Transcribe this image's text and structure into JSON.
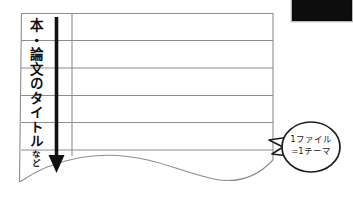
{
  "figure": {
    "type": "ruled-notebook-table-diagram",
    "background_color": "#ffffff",
    "line_color": "#8a8a8a",
    "arrow_color": "#111111",
    "callout_border_color": "#1a1a1a"
  },
  "vertical_label": {
    "main": "本・論文のタイトル",
    "suffix": "など",
    "full": "本・論文のタイトルなど",
    "orientation": "vertical",
    "name": "column-header-titles"
  },
  "arrow": {
    "name": "downward-arrow",
    "direction": "down",
    "color": "#111111"
  },
  "callout": {
    "line1": "1ファイル",
    "line2": "=1テーマ",
    "shape": "speech-balloon",
    "tail_direction": "left"
  },
  "table": {
    "rows": 6,
    "row_line_y": [
      13,
      40,
      68,
      95,
      122,
      150
    ],
    "left_column_divider_x": 72,
    "left_edge_x": 21,
    "right_edge_x": 273,
    "bottom_edge": "wavy-torn-paper"
  },
  "thumbnail": {
    "name": "black-photo-box",
    "color": "#0a0a0a"
  }
}
